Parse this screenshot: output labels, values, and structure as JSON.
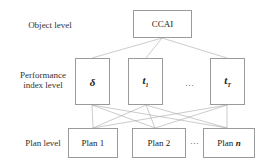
{
  "diagram": {
    "levels": {
      "object": "Object level",
      "performance_line1": "Performance",
      "performance_line2": "index level",
      "plan": "Plan level"
    },
    "object_node": "CCAI",
    "index_nodes": [
      {
        "symbol": "δ",
        "sub": ""
      },
      {
        "symbol": "t",
        "sub": "1"
      },
      {
        "symbol": "t",
        "sub": "T"
      }
    ],
    "index_ellipsis": "…",
    "plan_nodes": [
      {
        "label": "Plan 1",
        "n": ""
      },
      {
        "label": "Plan 2",
        "n": ""
      },
      {
        "label": "Plan ",
        "n": "n"
      }
    ],
    "plan_ellipsis": "…",
    "colors": {
      "line": "#a0a0a0",
      "box_border": "#9a9a9a"
    }
  }
}
